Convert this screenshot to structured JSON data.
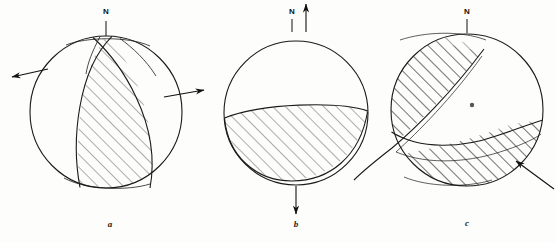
{
  "figure": {
    "type": "focal-mechanism-beachball-set",
    "background_color": "#fdfdfb",
    "line_color": "#1a1a1a",
    "hatch_color": "#4a4a4a",
    "panel_count": 3
  },
  "panels": [
    {
      "id": "a",
      "caption": "a",
      "caption_x": 110,
      "caption_y": 224,
      "north": {
        "label": "N",
        "label_x": 106,
        "label_y": 12,
        "tick_x": 106,
        "tick_y1": 22,
        "tick_y2": 34
      },
      "circle": {
        "cx": 106,
        "cy": 112,
        "r": 76
      },
      "arrows": [
        {
          "name": "left-slip-arrow",
          "x1": 48,
          "y1": 70,
          "x2": 10,
          "y2": 78,
          "direction": "left"
        },
        {
          "name": "right-slip-arrow",
          "x1": 166,
          "y1": 96,
          "x2": 206,
          "y2": 90,
          "direction": "right"
        }
      ],
      "mechanism": "strike-slip / vertical band compressional quadrant"
    },
    {
      "id": "b",
      "caption": "b",
      "caption_x": 296,
      "caption_y": 224,
      "north": {
        "label": "N",
        "label_x": 292,
        "label_y": 12,
        "tick_x": 292,
        "tick_y1": 20,
        "tick_y2": 30
      },
      "circle": {
        "cx": 296,
        "cy": 113,
        "r": 72
      },
      "arrows": [
        {
          "name": "up-axis-arrow",
          "x1": 306,
          "y1": 30,
          "x2": 306,
          "y2": 4,
          "direction": "up"
        },
        {
          "name": "down-axis-arrow",
          "x1": 296,
          "y1": 188,
          "x2": 296,
          "y2": 214,
          "direction": "down"
        }
      ],
      "mechanism": "dip-slip / lower lens compressional quadrant"
    },
    {
      "id": "c",
      "caption": "c",
      "caption_x": 467,
      "caption_y": 223,
      "north": {
        "label": "N",
        "label_x": 467,
        "label_y": 12,
        "tick_x": 467,
        "tick_y1": 20,
        "tick_y2": 30
      },
      "circle": {
        "cx": 467,
        "cy": 110,
        "r": 76
      },
      "center_dot": {
        "cx": 472,
        "cy": 105,
        "r": 2.2
      },
      "arrows": [
        {
          "name": "oblique-slip-arrow",
          "x1": 553,
          "y1": 188,
          "x2": 515,
          "y2": 160,
          "direction": "up-left"
        }
      ],
      "mechanism": "oblique-slip / two hatched opposing quadrants"
    }
  ]
}
